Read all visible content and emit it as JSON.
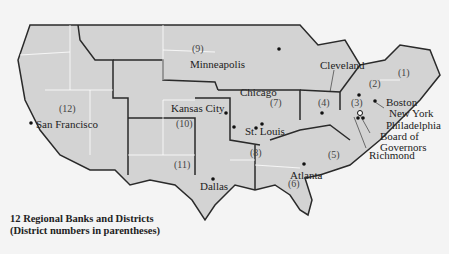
{
  "map": {
    "title": "12 Regional Banks and Districts",
    "subtitle": "(District numbers in parentheses)",
    "districts": [
      {
        "num": "(1)",
        "city": "Boston"
      },
      {
        "num": "(2)",
        "city": "New York"
      },
      {
        "num": "(3)",
        "city": "Philadelphia"
      },
      {
        "num": "(4)",
        "city": "Cleveland"
      },
      {
        "num": "(5)",
        "city": "Richmond"
      },
      {
        "num": "(6)",
        "city": "Atlanta"
      },
      {
        "num": "(7)",
        "city": "Chicago"
      },
      {
        "num": "(8)",
        "city": "St. Louis"
      },
      {
        "num": "(9)",
        "city": "Minneapolis"
      },
      {
        "num": "(10)",
        "city": "Kansas City"
      },
      {
        "num": "(11)",
        "city": "Dallas"
      },
      {
        "num": "(12)",
        "city": "San Francisco"
      }
    ],
    "board": {
      "line1": "Board of",
      "line2": "Governors"
    },
    "colors": {
      "land": "#d3d3d3",
      "border": "#2a2a2a",
      "state_line": "#ffffff",
      "background": "#f4f4f4"
    }
  }
}
